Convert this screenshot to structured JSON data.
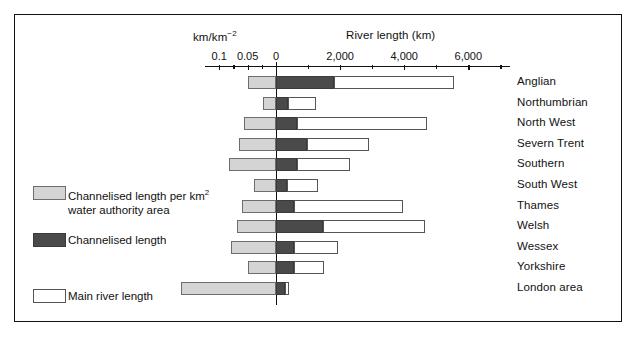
{
  "chart_data": {
    "type": "bar",
    "orientation": "horizontal",
    "title": "",
    "top_axis_left": {
      "label": "km/km⁻²",
      "ticks": [
        0.1,
        0.05,
        0
      ],
      "tick_labels": [
        "0.1",
        "0.05",
        "0"
      ],
      "range": [
        0.125,
        0
      ]
    },
    "top_axis_right": {
      "label": "River length (km)",
      "ticks": [
        0,
        2000,
        4000,
        6000
      ],
      "tick_labels": [
        "0",
        "2,000",
        "4,000",
        "6,000"
      ],
      "minor_ticks": [
        1000,
        3000,
        5000,
        7000
      ],
      "range": [
        0,
        7300
      ]
    },
    "categories": [
      "Anglian",
      "Northumbrian",
      "North West",
      "Severn Trent",
      "Southern",
      "South West",
      "Thames",
      "Welsh",
      "Wessex",
      "Yorkshire",
      "London area"
    ],
    "series": [
      {
        "name": "Channelised length per km2 water authority area",
        "units": "km/km-2",
        "direction": "left",
        "color": "#d4d4d4",
        "values": [
          0.049,
          0.023,
          0.057,
          0.066,
          0.082,
          0.039,
          0.059,
          0.068,
          0.079,
          0.05,
          0.168
        ]
      },
      {
        "name": "Channelised length",
        "units": "km",
        "direction": "right",
        "color": "#4a4a4a",
        "values": [
          1820,
          360,
          650,
          980,
          670,
          335,
          575,
          1460,
          550,
          575,
          290
        ]
      },
      {
        "name": "Main river length",
        "units": "km",
        "direction": "right",
        "color": "#ffffff",
        "values": [
          5540,
          1250,
          4720,
          2900,
          2320,
          1320,
          3960,
          4650,
          1920,
          1490,
          410
        ]
      }
    ],
    "legend": {
      "position": "left",
      "entries": [
        {
          "swatch": "light",
          "line1": "Channelised length per km",
          "sup": "2",
          "line2": "water authority area"
        },
        {
          "swatch": "dark",
          "line1": "Channelised length",
          "sup": "",
          "line2": ""
        },
        {
          "swatch": "white",
          "line1": "Main river length",
          "sup": "",
          "line2": ""
        }
      ]
    },
    "grid": false,
    "frame": true
  }
}
